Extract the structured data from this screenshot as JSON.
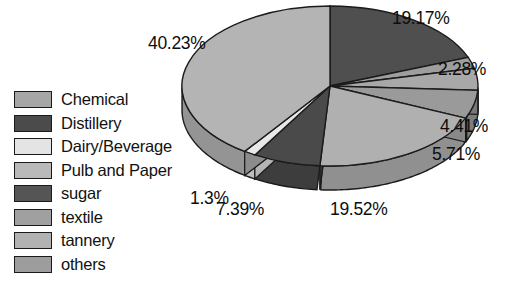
{
  "chart_data": {
    "type": "pie",
    "title": "",
    "legend_position": "left",
    "grid": false,
    "unit": "%",
    "categories": [
      "Chemical",
      "Distillery",
      "Dairy/Beverage",
      "Pulb and Paper",
      "sugar",
      "textile",
      "tannery",
      "others"
    ],
    "values": [
      40.23,
      19.17,
      1.3,
      19.52,
      7.39,
      2.28,
      4.41,
      5.71
    ],
    "labels": [
      "40.23%",
      "19.17%",
      "1.3%",
      "19.52%",
      "7.39%",
      "2.28%",
      "4.41%",
      "5.71%"
    ],
    "colors": [
      "#b4b4b4",
      "#4f4f4f",
      "#e8e8e8",
      "#b0b0b0",
      "#4a4a4a",
      "#9e9e9e",
      "#a8a8a8",
      "#9a9a9a"
    ],
    "slice_order_clockwise_from_top": [
      "Distillery",
      "textile",
      "tannery",
      "others",
      "Pulb and Paper",
      "sugar",
      "Dairy/Beverage",
      "Chemical"
    ]
  },
  "legend": {
    "items": [
      {
        "label": "Chemical",
        "color": "#a6a6a6"
      },
      {
        "label": "Distillery",
        "color": "#4b4b4b"
      },
      {
        "label": "Dairy/Beverage",
        "color": "#e4e4e4"
      },
      {
        "label": "Pulb and Paper",
        "color": "#b9b9b9"
      },
      {
        "label": "sugar",
        "color": "#555555"
      },
      {
        "label": "textile",
        "color": "#a0a0a0"
      },
      {
        "label": "tannery",
        "color": "#b2b2b2"
      },
      {
        "label": "others",
        "color": "#9d9d9d"
      }
    ]
  },
  "pie_labels": [
    {
      "name": "label-19-17",
      "text": "19.17%",
      "left": 392,
      "top": 8
    },
    {
      "name": "label-40-23",
      "text": "40.23%",
      "left": 148,
      "top": 33
    },
    {
      "name": "label-2-28",
      "text": "2.28%",
      "left": 438,
      "top": 59
    },
    {
      "name": "label-4-41",
      "text": "4.41%",
      "left": 440,
      "top": 116
    },
    {
      "name": "label-5-71",
      "text": "5.71%",
      "left": 432,
      "top": 144
    },
    {
      "name": "label-1-3",
      "text": "1.3%",
      "left": 190,
      "top": 188
    },
    {
      "name": "label-7-39",
      "text": "7.39%",
      "left": 216,
      "top": 199
    },
    {
      "name": "label-19-52",
      "text": "19.52%",
      "left": 330,
      "top": 199
    }
  ]
}
